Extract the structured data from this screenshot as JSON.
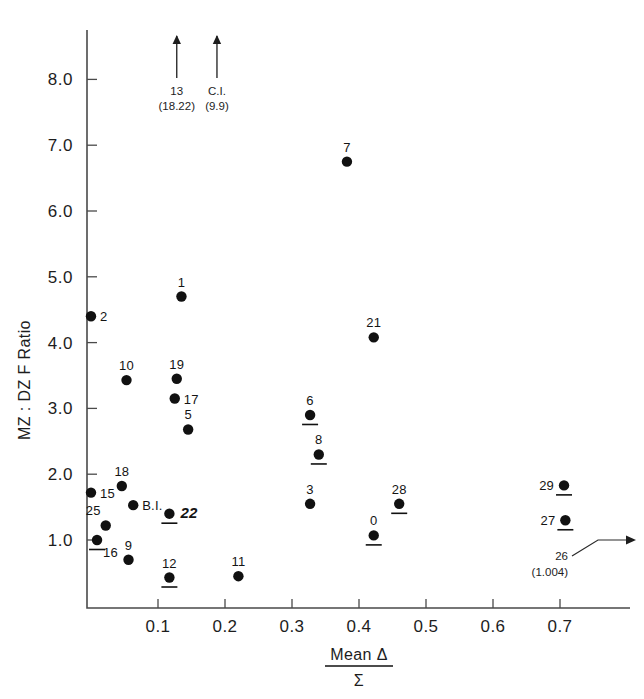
{
  "figure": {
    "title": "",
    "background": "#ffffff",
    "ink_color": "#111111"
  },
  "chart_data": {
    "type": "scatter",
    "title": "",
    "xlabel_numerator": "Mean Δ",
    "xlabel_denominator": "Σ",
    "ylabel": "MZ : DZ F Ratio",
    "xlim": [
      -0.02,
      0.78
    ],
    "ylim": [
      0.2,
      8.6
    ],
    "xticks": [
      0.1,
      0.2,
      0.3,
      0.4,
      0.5,
      0.6,
      0.7
    ],
    "xtick_labels": [
      "0.1",
      "0.2",
      "0.3",
      "0.4",
      "0.5",
      "0.6",
      "0.7"
    ],
    "yticks": [
      1.0,
      2.0,
      3.0,
      4.0,
      5.0,
      6.0,
      7.0,
      8.0
    ],
    "ytick_labels": [
      "1.0",
      "2.0",
      "3.0",
      "4.0",
      "5.0",
      "6.0",
      "7.0",
      "8.0"
    ],
    "grid": false,
    "legend": "none",
    "points": [
      {
        "label": "2",
        "x": 0.0,
        "y": 4.4,
        "label_pos": "right",
        "underline": false
      },
      {
        "label": "1",
        "x": 0.135,
        "y": 4.7,
        "label_pos": "top",
        "underline": false
      },
      {
        "label": "7",
        "x": 0.382,
        "y": 6.75,
        "label_pos": "top",
        "underline": false
      },
      {
        "label": "21",
        "x": 0.422,
        "y": 4.08,
        "label_pos": "top",
        "underline": false
      },
      {
        "label": "10",
        "x": 0.053,
        "y": 3.43,
        "label_pos": "top",
        "underline": false
      },
      {
        "label": "19",
        "x": 0.128,
        "y": 3.45,
        "label_pos": "top",
        "underline": false
      },
      {
        "label": "17",
        "x": 0.125,
        "y": 3.15,
        "label_pos": "right",
        "underline": false
      },
      {
        "label": "5",
        "x": 0.145,
        "y": 2.68,
        "label_pos": "top",
        "underline": false
      },
      {
        "label": "6",
        "x": 0.327,
        "y": 2.9,
        "label_pos": "top",
        "underline": true
      },
      {
        "label": "8",
        "x": 0.34,
        "y": 2.3,
        "label_pos": "top",
        "underline": true
      },
      {
        "label": "18",
        "x": 0.046,
        "y": 1.82,
        "label_pos": "top",
        "underline": false
      },
      {
        "label": "29",
        "x": 0.706,
        "y": 1.83,
        "label_pos": "left",
        "underline": true
      },
      {
        "label": "15",
        "x": 0.0,
        "y": 1.72,
        "label_pos": "right",
        "underline": false
      },
      {
        "label": "3",
        "x": 0.327,
        "y": 1.55,
        "label_pos": "top",
        "underline": false
      },
      {
        "label": "28",
        "x": 0.46,
        "y": 1.55,
        "label_pos": "top",
        "underline": true
      },
      {
        "label": "B.I.",
        "x": 0.063,
        "y": 1.53,
        "label_pos": "right",
        "underline": false
      },
      {
        "label": "22",
        "x": 0.117,
        "y": 1.4,
        "label_pos": "right-bold",
        "underline": true
      },
      {
        "label": "27",
        "x": 0.708,
        "y": 1.3,
        "label_pos": "left",
        "underline": true
      },
      {
        "label": "25",
        "x": 0.022,
        "y": 1.22,
        "label_pos": "topleft",
        "underline": false
      },
      {
        "label": "0",
        "x": 0.422,
        "y": 1.07,
        "label_pos": "top",
        "underline": true
      },
      {
        "label": "16",
        "x": 0.009,
        "y": 1.0,
        "label_pos": "bottomright",
        "underline": true
      },
      {
        "label": "9",
        "x": 0.056,
        "y": 0.7,
        "label_pos": "top",
        "underline": false
      },
      {
        "label": "12",
        "x": 0.117,
        "y": 0.43,
        "label_pos": "top",
        "underline": true
      },
      {
        "label": "11",
        "x": 0.22,
        "y": 0.45,
        "label_pos": "top",
        "underline": false
      }
    ],
    "offscale_arrows": [
      {
        "id": "13",
        "label": "13",
        "value_text": "(18.22)",
        "x": 0.128,
        "direction": "up"
      },
      {
        "id": "C.I.",
        "label": "C.I.",
        "value_text": "(9.9)",
        "x": 0.188,
        "direction": "up"
      }
    ],
    "offscale_right": {
      "id": "26",
      "label": "26",
      "value_text": "(1.004)",
      "y": 1.18,
      "direction": "right"
    }
  },
  "annotations": {
    "arrow_13_label": "13",
    "arrow_13_value": "(18.22)",
    "arrow_ci_label": "C.I.",
    "arrow_ci_value": "(9.9)",
    "point_26_label": "26",
    "point_26_value": "(1.004)"
  }
}
